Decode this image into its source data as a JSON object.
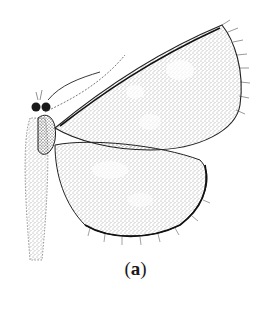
{
  "figure": {
    "panel_label_open": "(",
    "panel_label_letter": "a",
    "panel_label_close": ")",
    "ink_color": "#1a1a1a",
    "paper_color": "#ffffff"
  }
}
